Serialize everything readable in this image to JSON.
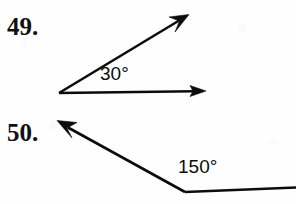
{
  "page": {
    "background_color": "#fefefe",
    "ink_color": "#0c0c0c",
    "width": 296,
    "height": 204
  },
  "problems": [
    {
      "number_label": "49.",
      "angle_value": "30°",
      "angle_degrees": 30,
      "description": "Acute angle formed by two rays from a common vertex; lower ray horizontal pointing right, upper ray pointing up and to the right.",
      "vertex": {
        "x": 59,
        "y": 93
      },
      "rays": [
        {
          "name": "horizontal-ray",
          "tip_x": 205,
          "tip_y": 91,
          "arrow": true
        },
        {
          "name": "upper-ray",
          "tip_x": 188,
          "tip_y": 15,
          "arrow": true
        }
      ],
      "label_position": {
        "x": 100,
        "y": 64
      }
    },
    {
      "number_label": "50.",
      "angle_value": "150°",
      "angle_degrees": 150,
      "description": "Obtuse angle formed at a vertex; one ray goes horizontally right off the page edge, the other ray points up and to the left with an arrowhead.",
      "vertex": {
        "x": 185,
        "y": 192
      },
      "rays": [
        {
          "name": "horizontal-ray",
          "tip_x": 296,
          "tip_y": 188,
          "arrow": false
        },
        {
          "name": "upper-left-ray",
          "tip_x": 58,
          "tip_y": 121,
          "arrow": true
        }
      ],
      "label_position": {
        "x": 178,
        "y": 157
      }
    }
  ]
}
